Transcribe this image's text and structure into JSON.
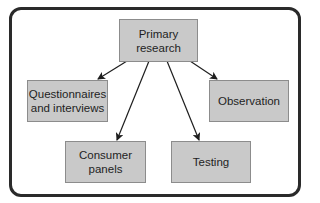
{
  "diagram": {
    "type": "hierarchy",
    "root": {
      "id": "primary",
      "label_line1": "Primary",
      "label_line2": "research"
    },
    "children": [
      {
        "id": "questionnaires",
        "label_line1": "Questionnaires",
        "label_line2": "and interviews"
      },
      {
        "id": "consumer-panels",
        "label_line1": "Consumer",
        "label_line2": "panels"
      },
      {
        "id": "testing",
        "label_line1": "Testing",
        "label_line2": ""
      },
      {
        "id": "observation",
        "label_line1": "Observation",
        "label_line2": ""
      }
    ],
    "edges": [
      {
        "from": "primary",
        "to": "questionnaires"
      },
      {
        "from": "primary",
        "to": "consumer-panels"
      },
      {
        "from": "primary",
        "to": "testing"
      },
      {
        "from": "primary",
        "to": "observation"
      }
    ]
  },
  "colors": {
    "node_fill": "#c9c9c9",
    "node_border": "#8c8c8c",
    "frame_border": "#2a2a2a",
    "arrow": "#1e1e1e",
    "background": "#ffffff"
  }
}
